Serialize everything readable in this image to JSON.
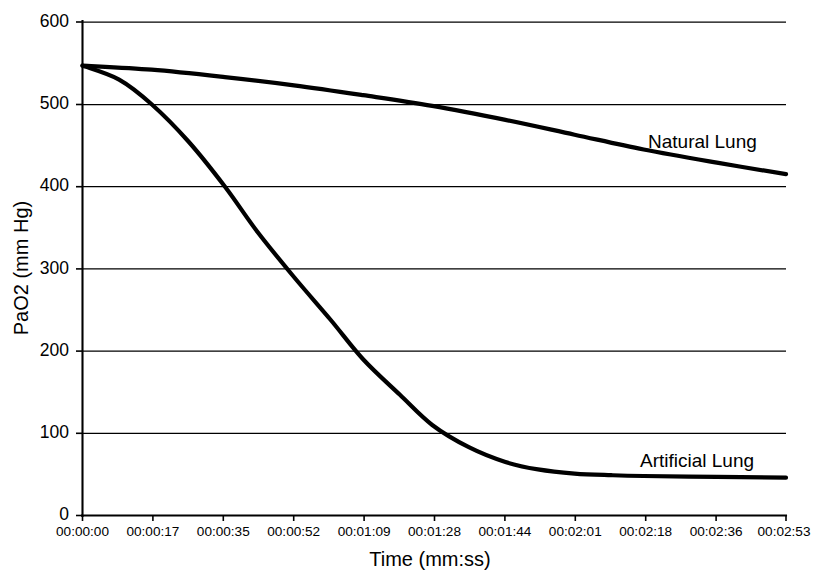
{
  "chart_data": {
    "type": "line",
    "title": "",
    "xlabel": "Time (mm:ss)",
    "ylabel": "PaO2 (mm Hg)",
    "xtick_labels": [
      "00:00:00",
      "00:00:17",
      "00:00:35",
      "00:00:52",
      "00:01:09",
      "00:01:28",
      "00:01:44",
      "00:02:01",
      "00:02:18",
      "00:02:36",
      "00:02:53"
    ],
    "ytick_labels": [
      "0",
      "100",
      "200",
      "300",
      "400",
      "500",
      "600"
    ],
    "ylim": [
      0,
      600
    ],
    "xlim": [
      0,
      173
    ],
    "grid": "horizontal",
    "legend_position": "inline-right",
    "line_color": "#000000",
    "series": [
      {
        "name": "Natural Lung",
        "label_text": "Natural Lung",
        "x": [
          0,
          17,
          35,
          52,
          69,
          86,
          104,
          121,
          138,
          156,
          173
        ],
        "values": [
          547,
          542,
          533,
          523,
          511,
          498,
          481,
          463,
          445,
          429,
          415
        ]
      },
      {
        "name": "Artificial Lung",
        "label_text": "Artificial Lung",
        "x": [
          0,
          9,
          17,
          26,
          35,
          43,
          52,
          61,
          69,
          78,
          86,
          95,
          104,
          112,
          121,
          130,
          138,
          156,
          173
        ],
        "values": [
          547,
          530,
          500,
          455,
          400,
          345,
          290,
          238,
          190,
          147,
          110,
          83,
          65,
          56,
          51,
          49,
          48,
          47,
          46
        ]
      }
    ]
  },
  "annotations": {
    "natural_lung_label": "Natural Lung",
    "artificial_lung_label": "Artificial Lung"
  }
}
